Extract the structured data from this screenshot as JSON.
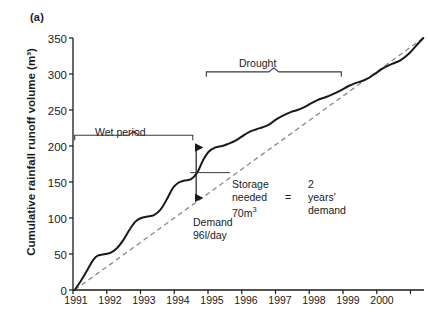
{
  "figure": {
    "panel_label": "(a)",
    "ylabel": "Cumulative rainfall runoff volume (m³)"
  },
  "annotations": {
    "wet_period": "Wet period",
    "drought": "Drought",
    "demand_line_1": "Demand",
    "demand_line_2": "96l/day",
    "storage_1": "Storage",
    "storage_2": "needed",
    "storage_3": "70m",
    "storage_3_sup": "3",
    "equals": "=",
    "result_1": "2",
    "result_2": "years'",
    "result_3": "demand"
  },
  "chart_data": {
    "type": "line",
    "title": "",
    "xlabel": "",
    "ylabel": "Cumulative rainfall runoff volume (m³)",
    "xlim": [
      1990.5,
      2000.9
    ],
    "ylim": [
      0,
      350
    ],
    "yticks": [
      0,
      50,
      100,
      150,
      200,
      250,
      300,
      350
    ],
    "ytick_labels": [
      "0",
      "50",
      "100",
      "150",
      "200",
      "250",
      "300",
      "350"
    ],
    "xtick_labels": [
      "1991",
      "1992",
      "1993",
      "1994",
      "1995",
      "1996",
      "1997",
      "1998",
      "1999",
      "2000"
    ],
    "xtick_positions": [
      1991,
      1992,
      1993,
      1994,
      1995,
      1996,
      1997,
      1998,
      1999,
      2000
    ],
    "grid": false,
    "legend": "none",
    "series": [
      {
        "name": "Cumulative rainfall runoff volume",
        "style": "solid",
        "color": "#1a1a1a",
        "x": [
          1990.55,
          1990.75,
          1990.95,
          1991.1,
          1991.25,
          1991.45,
          1991.62,
          1991.8,
          1992.0,
          1992.18,
          1992.35,
          1992.52,
          1992.7,
          1992.9,
          1993.1,
          1993.28,
          1993.45,
          1993.62,
          1993.8,
          1994.0,
          1994.18,
          1994.35,
          1994.52,
          1994.72,
          1994.92,
          1995.1,
          1995.3,
          1995.5,
          1995.7,
          1995.92,
          1996.12,
          1996.32,
          1996.52,
          1996.75,
          1996.95,
          1997.15,
          1997.35,
          1997.58,
          1997.8,
          1998.0,
          1998.2,
          1998.42,
          1998.65,
          1998.85,
          1999.05,
          1999.28,
          1999.5,
          1999.72,
          1999.95,
          2000.2,
          2000.45,
          2000.7,
          2000.88
        ],
        "y": [
          0,
          14,
          30,
          42,
          48,
          50,
          52,
          58,
          70,
          84,
          95,
          100,
          102,
          104,
          112,
          126,
          141,
          149,
          152,
          154,
          163,
          180,
          192,
          198,
          200,
          203,
          207,
          213,
          219,
          223,
          226,
          230,
          237,
          243,
          247,
          250,
          254,
          260,
          265,
          268,
          272,
          277,
          283,
          287,
          290,
          295,
          302,
          309,
          314,
          319,
          328,
          341,
          350
        ]
      },
      {
        "name": "Demand 96 l/day",
        "style": "dashed",
        "color": "#808080",
        "x": [
          1990.55,
          2000.88
        ],
        "y": [
          0,
          350
        ]
      }
    ],
    "brackets": [
      {
        "label": "Wet period",
        "x_start": 1990.55,
        "x_end": 1994.05,
        "y": 215
      },
      {
        "label": "Drought",
        "x_start": 1994.45,
        "x_end": 1998.45,
        "y": 303
      }
    ],
    "measure_arrow": {
      "x": 1994.15,
      "y_top": 198,
      "y_bottom": 128,
      "value": 70,
      "unit": "m³"
    }
  }
}
